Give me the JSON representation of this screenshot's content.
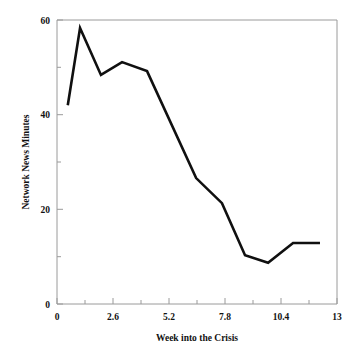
{
  "chart_data": {
    "type": "line",
    "title": "",
    "xlabel": "Week into the Crisis",
    "ylabel": "Network News Minutes",
    "xlim": [
      0,
      13
    ],
    "ylim": [
      0,
      60
    ],
    "grid": false,
    "legend": null,
    "x_major_ticks": [
      0,
      2.6,
      5.2,
      7.8,
      10.4,
      13
    ],
    "x_major_tick_labels": [
      "0",
      "2.6",
      "5.2",
      "7.8",
      "10.4",
      "13"
    ],
    "x_minor_ticks": [
      1.3,
      3.9,
      6.5,
      9.1,
      11.7
    ],
    "y_major_ticks": [
      0,
      20,
      40,
      60
    ],
    "y_major_tick_labels": [
      "0",
      "20",
      "40",
      "60"
    ],
    "y_minor_ticks": [
      10,
      30,
      50
    ],
    "line_color": "#101010",
    "frame_color": "#9a9a9a",
    "x": [
      0.5,
      1.07,
      2.04,
      3.02,
      4.18,
      6.46,
      7.66,
      8.73,
      9.8,
      10.96,
      12.21
    ],
    "values": [
      42.0,
      58.3,
      48.4,
      51.1,
      49.2,
      26.6,
      21.3,
      10.3,
      8.7,
      12.9,
      12.9
    ],
    "series": [
      {
        "name": "Network News Minutes",
        "points": [
          {
            "x": 0.5,
            "y": 42.0
          },
          {
            "x": 1.07,
            "y": 58.3
          },
          {
            "x": 2.04,
            "y": 48.4
          },
          {
            "x": 3.02,
            "y": 51.1
          },
          {
            "x": 4.18,
            "y": 49.2
          },
          {
            "x": 6.46,
            "y": 26.6
          },
          {
            "x": 7.66,
            "y": 21.3
          },
          {
            "x": 8.73,
            "y": 10.3
          },
          {
            "x": 9.8,
            "y": 8.7
          },
          {
            "x": 10.96,
            "y": 12.9
          },
          {
            "x": 12.21,
            "y": 12.9
          }
        ]
      }
    ]
  },
  "axes": {
    "y_tick_0": "0",
    "y_tick_20": "20",
    "y_tick_40": "40",
    "y_tick_60": "60",
    "x_tick_0": "0",
    "x_tick_1": "2.6",
    "x_tick_2": "5.2",
    "x_tick_3": "7.8",
    "x_tick_4": "10.4",
    "x_tick_5": "13",
    "x_axis_title": "Week into the Crisis",
    "y_axis_title": "Network News Minutes"
  }
}
